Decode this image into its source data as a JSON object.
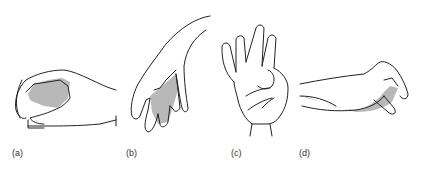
{
  "figure": {
    "panels": [
      {
        "id": "a",
        "label": "(a)",
        "description": "hand in pinch grip, side view"
      },
      {
        "id": "b",
        "label": "(b)",
        "description": "hand hanging downward, fingers pointing down"
      },
      {
        "id": "c",
        "label": "(c)",
        "description": "open palm facing viewer, thumb folded"
      },
      {
        "id": "d",
        "label": "(d)",
        "description": "hand and forearm horizontal, fingers curled"
      }
    ],
    "colors": {
      "line": "#222222",
      "shade": "#b8b8b8",
      "background": "#ffffff"
    }
  }
}
